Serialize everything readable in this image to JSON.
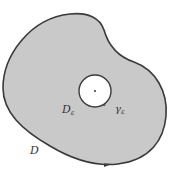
{
  "diagram": {
    "region_label": "D",
    "region_sub_label": "D",
    "region_sub_subscript": "ε",
    "circle_label": "γ",
    "circle_subscript": "ε",
    "colors": {
      "fill": "#c9c9c9",
      "stroke": "#3a3a3a",
      "hole": "#ffffff"
    }
  }
}
